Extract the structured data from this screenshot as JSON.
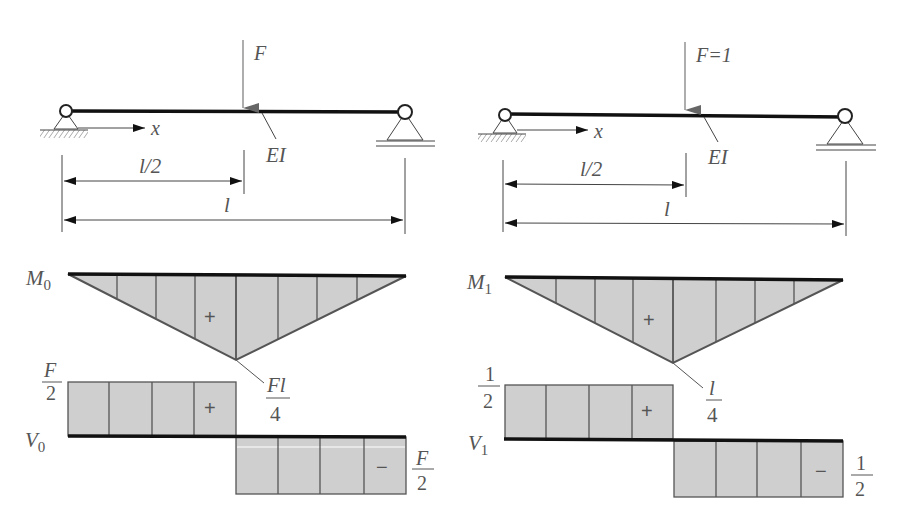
{
  "left_panel": {
    "load_label": "F",
    "axis_label": "x",
    "stiffness_label": "EI",
    "dim_half_label": "l/2",
    "dim_full_label": "l",
    "moment": {
      "name_base": "M",
      "name_sub": "0",
      "sign": "+",
      "peak_num": "Fl",
      "peak_den": "4"
    },
    "shear": {
      "name_base": "V",
      "name_sub": "0",
      "pos_sign": "+",
      "neg_sign": "−",
      "pos_num": "F",
      "pos_den": "2",
      "neg_num": "F",
      "neg_den": "2"
    }
  },
  "right_panel": {
    "load_label": "F=1",
    "axis_label": "x",
    "stiffness_label": "EI",
    "dim_half_label": "l/2",
    "dim_full_label": "l",
    "moment": {
      "name_base": "M",
      "name_sub": "1",
      "sign": "+",
      "peak_num": "l",
      "peak_den": "4"
    },
    "shear": {
      "name_base": "V",
      "name_sub": "1",
      "pos_sign": "+",
      "neg_sign": "−",
      "pos_num": "1",
      "pos_den": "2",
      "neg_num": "1",
      "neg_den": "2"
    }
  },
  "colors": {
    "fill": "#cfcfcf",
    "stroke": "#555555",
    "beam": "#111111"
  }
}
